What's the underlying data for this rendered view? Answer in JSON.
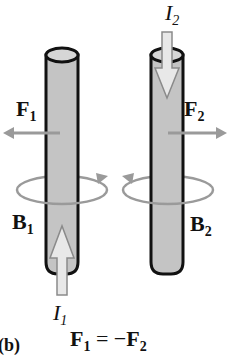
{
  "figure": {
    "panel_label": "(b)",
    "equation": {
      "lhs": "F",
      "lhs_sub": "1",
      "op": "= −",
      "rhs": "F",
      "rhs_sub": "2"
    }
  },
  "wire_left": {
    "current": {
      "symbol": "I",
      "sub": "1",
      "direction": "up"
    },
    "force": {
      "symbol": "F",
      "sub": "1",
      "direction": "left"
    },
    "field": {
      "symbol": "B",
      "sub": "1",
      "rotation": "counterclockwise (viewed from above)"
    }
  },
  "wire_right": {
    "current": {
      "symbol": "I",
      "sub": "2",
      "direction": "down"
    },
    "force": {
      "symbol": "F",
      "sub": "2",
      "direction": "right"
    },
    "field": {
      "symbol": "B",
      "sub": "2",
      "rotation": "clockwise (viewed from above)"
    }
  },
  "colors": {
    "rod_fill": "#c4c4c4",
    "rod_outline": "#111111",
    "arrow_gray": "#9a9a9a",
    "current_arrow_fill": "#e8e8e8"
  }
}
